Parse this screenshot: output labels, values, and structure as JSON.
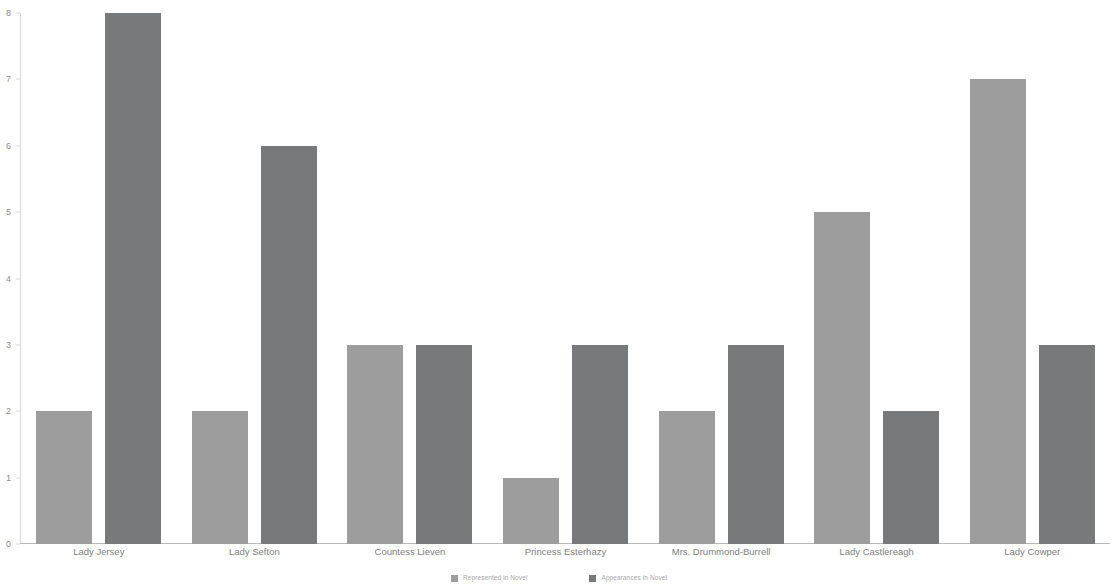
{
  "chart_data": {
    "type": "bar",
    "title": "",
    "subtitle": "",
    "xlabel": "",
    "ylabel": "",
    "ylim": [
      0,
      8
    ],
    "ytick_values": [
      0,
      1,
      2,
      3,
      4,
      5,
      6,
      7,
      8
    ],
    "ytick_labels": [
      "0",
      "1",
      "2",
      "3",
      "4",
      "5",
      "6",
      "7",
      "8"
    ],
    "grid": false,
    "legend_position": "bottom-center",
    "categories": [
      "Lady Jersey",
      "Lady Sefton",
      "Countess Lieven",
      "Princess Esterhazy",
      "Mrs. Drummond-Burrell",
      "Lady Castlereagh",
      "Lady Cowper"
    ],
    "series": [
      {
        "name": "Represented in Novel",
        "color": "#9d9d9d",
        "values": [
          2,
          2,
          3,
          1,
          2,
          5,
          7
        ]
      },
      {
        "name": "Appearances in Novel",
        "color": "#77797a",
        "values": [
          8,
          6,
          3,
          3,
          3,
          2,
          3
        ]
      }
    ]
  }
}
